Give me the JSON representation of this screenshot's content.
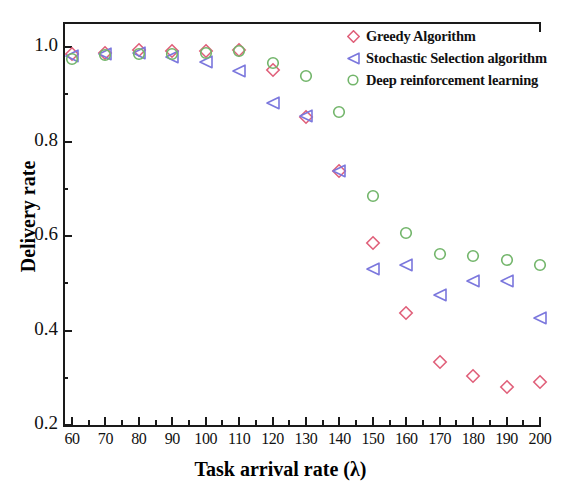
{
  "chart_data": {
    "type": "scatter",
    "title": "",
    "xlabel": "Task arrival rate (λ)",
    "ylabel": "Delivery rate",
    "xlim": [
      55,
      205
    ],
    "ylim": [
      0.2,
      1.08
    ],
    "x": [
      60,
      70,
      80,
      90,
      100,
      110,
      120,
      130,
      140,
      150,
      160,
      170,
      180,
      190,
      200
    ],
    "xticks": [
      "60",
      "70",
      "80",
      "90",
      "100",
      "110",
      "120",
      "130",
      "140",
      "150",
      "160",
      "170",
      "180",
      "190",
      "200"
    ],
    "yticks": [
      "0.2",
      "0.4",
      "0.6",
      "0.8",
      "1.0"
    ],
    "grid": false,
    "legend_position": "top-right",
    "series": [
      {
        "name": "Greedy Algorithm",
        "marker": "diamond",
        "color": "#e0607a",
        "values": [
          0.985,
          0.988,
          0.993,
          0.992,
          0.992,
          0.993,
          0.952,
          0.852,
          0.737,
          0.586,
          0.437,
          0.333,
          0.303,
          0.28,
          0.291
        ]
      },
      {
        "name": "Stochastic Selection algorithm",
        "marker": "triangle-left",
        "color": "#7b77dd",
        "values": [
          0.982,
          0.986,
          0.988,
          0.978,
          0.968,
          0.95,
          0.882,
          0.853,
          0.737,
          0.531,
          0.539,
          0.475,
          0.505,
          0.505,
          0.427
        ]
      },
      {
        "name": "Deep reinforcement learning",
        "marker": "circle",
        "color": "#72b56a",
        "values": [
          0.975,
          0.984,
          0.985,
          0.985,
          0.988,
          0.991,
          0.967,
          0.938,
          0.862,
          0.685,
          0.606,
          0.562,
          0.557,
          0.549,
          0.539
        ]
      }
    ]
  },
  "axis": {
    "x_minor_count": 1,
    "y_minor_count": 1
  }
}
